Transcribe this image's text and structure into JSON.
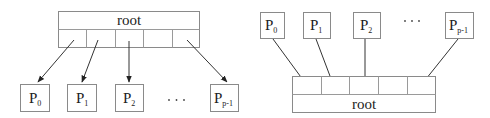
{
  "left_diagram": {
    "root_label": "root",
    "cells": 5,
    "processes": [
      {
        "base": "P",
        "sub": "0"
      },
      {
        "base": "P",
        "sub": "1"
      },
      {
        "base": "P",
        "sub": "2"
      },
      {
        "base": "P",
        "sub": "p-1"
      }
    ],
    "ellipsis": "· · ·",
    "direction": "root-to-processes"
  },
  "right_diagram": {
    "root_label": "root",
    "cells": 5,
    "processes": [
      {
        "base": "P",
        "sub": "0"
      },
      {
        "base": "P",
        "sub": "1"
      },
      {
        "base": "P",
        "sub": "2"
      },
      {
        "base": "P",
        "sub": "p-1"
      }
    ],
    "ellipsis": "· · ·",
    "direction": "processes-to-root"
  },
  "colors": {
    "box_stroke": "#8a8a8a",
    "arrow": "#333333",
    "text": "#222222"
  }
}
